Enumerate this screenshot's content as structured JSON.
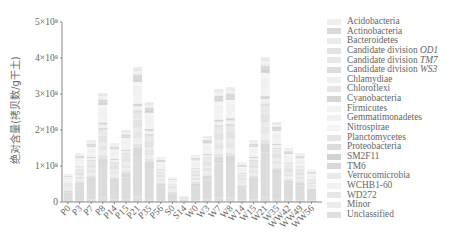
{
  "chart_data": {
    "type": "bar",
    "stacked": true,
    "title": "",
    "xlabel": "",
    "ylabel": "绝对含量(拷贝数/g干土)",
    "ylim": [
      0,
      500000000
    ],
    "yticks": [
      0,
      100000000,
      200000000,
      300000000,
      400000000,
      500000000
    ],
    "ytick_labels": [
      "0",
      "1×10⁸",
      "2×10⁸",
      "3×10⁸",
      "4×10⁸",
      "5×10⁸"
    ],
    "grid": false,
    "legend_position": "right",
    "categories": [
      "P0",
      "P3",
      "P7",
      "P8",
      "P14",
      "P15",
      "P21",
      "P35",
      "P56",
      "S0",
      "S14",
      "W0",
      "W3",
      "W7",
      "W8",
      "W14",
      "W15",
      "W21",
      "W35",
      "WW42",
      "WW49",
      "WW56"
    ],
    "totals": [
      78000000,
      136000000,
      172000000,
      303000000,
      164000000,
      200000000,
      375000000,
      278000000,
      125000000,
      68000000,
      15000000,
      130000000,
      183000000,
      314000000,
      319000000,
      110000000,
      172000000,
      403000000,
      222000000,
      150000000,
      136000000,
      89000000
    ],
    "series": [
      {
        "name": "Acidobacteria",
        "color": "#eeeeee"
      },
      {
        "name": "Actinobacteria",
        "color": "#d9d9d9"
      },
      {
        "name": "Bacteroidetes",
        "color": "#ebebeb"
      },
      {
        "name": "Candidate division OD1",
        "color": "#e3e3e3"
      },
      {
        "name": "Candidate division TM7",
        "color": "#e8e8e8"
      },
      {
        "name": "Candidate division WS3",
        "color": "#dedede"
      },
      {
        "name": "Chlamydiae",
        "color": "#f0f0f0"
      },
      {
        "name": "Chloroflexi",
        "color": "#e6e6e6"
      },
      {
        "name": "Cyanobacteria",
        "color": "#d6d6d6"
      },
      {
        "name": "Firmicutes",
        "color": "#f3f3f3"
      },
      {
        "name": "Gemmatimonadetes",
        "color": "#f1f1f1"
      },
      {
        "name": "Nitrospirae",
        "color": "#f5f5f5"
      },
      {
        "name": "Planctomycetes",
        "color": "#e4e4e4"
      },
      {
        "name": "Proteobacteria",
        "color": "#dcdcdc"
      },
      {
        "name": "SM2F11",
        "color": "#d3d3d3"
      },
      {
        "name": "TM6",
        "color": "#d8d8d8"
      },
      {
        "name": "Verrucomicrobia",
        "color": "#eaeaea"
      },
      {
        "name": "WCHB1-60",
        "color": "#f2f2f2"
      },
      {
        "name": "WD272",
        "color": "#e7e7e7"
      },
      {
        "name": "Minor",
        "color": "#ececec"
      },
      {
        "name": "Unclassified",
        "color": "#dfdfdf"
      }
    ]
  },
  "legend": {
    "items": [
      {
        "label": "Acidobacteria"
      },
      {
        "label": "Actinobacteria"
      },
      {
        "label": "Bacteroidetes"
      },
      {
        "label": "Candidate division ",
        "italic": "OD1"
      },
      {
        "label": "Candidate division ",
        "italic": "TM7"
      },
      {
        "label": "Candidate division ",
        "italic": "WS3"
      },
      {
        "label": "Chlamydiae"
      },
      {
        "label": "Chloroflexi"
      },
      {
        "label": "Cyanobacteria"
      },
      {
        "label": "Firmicutes"
      },
      {
        "label": "Gemmatimonadetes"
      },
      {
        "label": "Nitrospirae"
      },
      {
        "label": "Planctomycetes"
      },
      {
        "label": "Proteobacteria"
      },
      {
        "label": "SM2F11"
      },
      {
        "label": "TM6"
      },
      {
        "label": "Verrucomicrobia"
      },
      {
        "label": "WCHB1-60"
      },
      {
        "label": "WD272"
      },
      {
        "label": "Minor"
      },
      {
        "label": "Unclassified"
      }
    ]
  },
  "colors": {
    "axis": "#888888",
    "text": "#666666"
  }
}
